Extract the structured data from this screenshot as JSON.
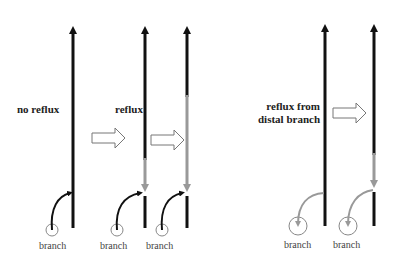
{
  "labels": {
    "no_reflux": "no reflux",
    "reflux": "reflux",
    "reflux_from_distal_line1": "reflux from",
    "reflux_from_distal_line2": "distal branch",
    "branch": "branch"
  },
  "branch_labels": [
    "branch",
    "branch",
    "branch",
    "branch",
    "branch"
  ],
  "colors": {
    "vessel": "#111111",
    "reflux": "#999999",
    "circle": "#888888",
    "hollow_arrow": "#777777"
  },
  "panels": [
    {
      "id": "no-reflux",
      "label": "no reflux",
      "vessels": 1,
      "flow": "branch-to-trunk"
    },
    {
      "id": "reflux",
      "label": "reflux",
      "vessels": 2,
      "flow": "trunk-reflux-into-junction"
    },
    {
      "id": "reflux-from-distal-branch",
      "label": "reflux from distal branch",
      "vessels": 2,
      "flow": "trunk-to-branch"
    }
  ]
}
